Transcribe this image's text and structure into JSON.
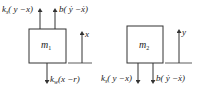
{
  "diagram": {
    "title": "",
    "bodies": [
      {
        "id": "m1",
        "label": "m",
        "subscript": "1",
        "coordinate": "x",
        "forces": [
          {
            "coef": "k",
            "coef_sub": "s",
            "expr": "( y −x)",
            "direction": "up"
          },
          {
            "coef": "b",
            "coef_sub": "",
            "expr": "( ẏ −ẋ)",
            "direction": "up"
          },
          {
            "coef": "k",
            "coef_sub": "w",
            "expr": "(x −r)",
            "direction": "down"
          }
        ]
      },
      {
        "id": "m2",
        "label": "m",
        "subscript": "2",
        "coordinate": "y",
        "forces": [
          {
            "coef": "k",
            "coef_sub": "s",
            "expr": "( y −x)",
            "direction": "down"
          },
          {
            "coef": "b",
            "coef_sub": "",
            "expr": "( ẏ −ẋ)",
            "direction": "down"
          }
        ]
      }
    ],
    "colors": {
      "stroke": "#333333",
      "text": "#222222",
      "background": "#ffffff"
    }
  }
}
